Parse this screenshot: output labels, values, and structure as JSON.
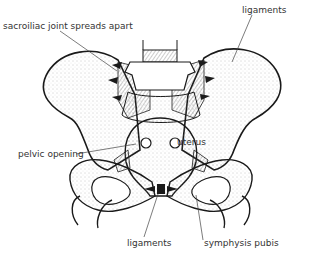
{
  "figure": {
    "colors": {
      "ink": "#1a1a1a",
      "label": "#333333",
      "background": "#ffffff",
      "stipple": "#999999"
    }
  },
  "labels": {
    "sacroiliac": "sacroiliac joint spreads apart",
    "ligaments_top": "ligaments",
    "pelvic_opening": "pelvic opening",
    "uterus": "uterus",
    "ligaments_bottom": "ligaments",
    "symphysis": "symphysis pubis"
  }
}
